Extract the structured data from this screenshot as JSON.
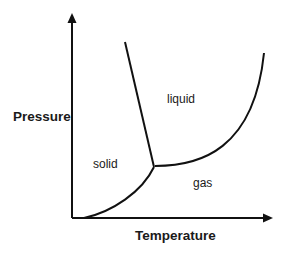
{
  "diagram": {
    "type": "phase-diagram",
    "axes": {
      "x_label": "Temperature",
      "y_label": "Pressure"
    },
    "regions": {
      "solid": "solid",
      "liquid": "liquid",
      "gas": "gas"
    },
    "curves": [
      {
        "name": "sublimation-curve",
        "from": "origin",
        "to": "triple-point"
      },
      {
        "name": "melting-curve",
        "from": "triple-point",
        "to": "upper-left"
      },
      {
        "name": "vaporization-curve",
        "from": "triple-point",
        "to": "upper-right"
      }
    ],
    "colors": {
      "line": "#111111",
      "text": "#1a1a1a",
      "background": "#ffffff"
    }
  }
}
